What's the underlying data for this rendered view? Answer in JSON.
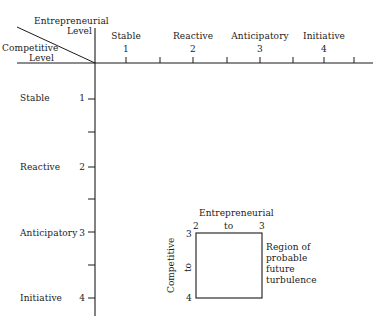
{
  "corner": {
    "top_label_line1": "Entrepreneurial",
    "top_label_line2": "Level",
    "bottom_label_line1": "Competitive",
    "bottom_label_line2": "Level"
  },
  "horizontal_axis": {
    "name": "Entrepreneurial Level",
    "categories": [
      {
        "label": "Stable",
        "number": "1"
      },
      {
        "label": "Reactive",
        "number": "2"
      },
      {
        "label": "Anticipatory",
        "number": "3"
      },
      {
        "label": "Initiative",
        "number": "4"
      }
    ]
  },
  "vertical_axis": {
    "name": "Competitive Level",
    "categories": [
      {
        "label": "Stable",
        "number": "1"
      },
      {
        "label": "Reactive",
        "number": "2"
      },
      {
        "label": "Anticipatory",
        "number": "3"
      },
      {
        "label": "Initiative",
        "number": "4"
      }
    ]
  },
  "region_box": {
    "top_title": "Entrepreneurial",
    "top_left": "2",
    "top_mid": "to",
    "top_right": "3",
    "side_title": "Competitive",
    "side_top": "3",
    "side_mid": "to",
    "side_bottom": "4",
    "annotation_line1": "Region of",
    "annotation_line2": "probable",
    "annotation_line3": "future",
    "annotation_line4": "turbulence"
  },
  "colors": {
    "line": "#1a1a1a",
    "background": "#ffffff"
  }
}
